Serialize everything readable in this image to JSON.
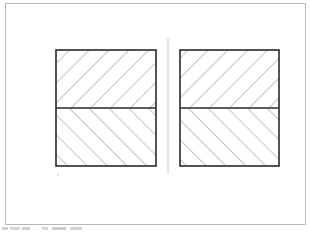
{
  "diagram": {
    "type": "technical-drawing",
    "colors": {
      "outline": "#2a2a2a",
      "hatch": "#7a7a7a",
      "frame": "#b8b8b8",
      "centerline": "#c8c8c8"
    },
    "blocks": [
      {
        "id": "left",
        "x": 56,
        "y": 50,
        "width": 100,
        "height": 116,
        "divider_y": 108,
        "top_hatch": "forward-diagonal",
        "bottom_hatch": "back-diagonal"
      },
      {
        "id": "right",
        "x": 180,
        "y": 50,
        "width": 99,
        "height": 116,
        "divider_y": 108,
        "top_hatch": "forward-diagonal",
        "bottom_hatch": "back-diagonal"
      }
    ],
    "centerline": {
      "x": 168,
      "y1": 38,
      "y2": 174
    }
  }
}
